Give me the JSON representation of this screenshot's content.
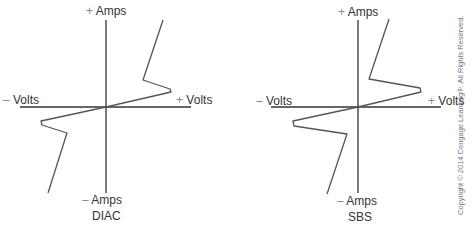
{
  "figures": [
    {
      "id": "diac",
      "caption": "DIAC",
      "labels": {
        "pos_amps": {
          "sign": "+",
          "text": "Amps"
        },
        "neg_amps": {
          "sign": "–",
          "text": "Amps"
        },
        "neg_volts": {
          "sign": "–",
          "text": "Volts"
        },
        "pos_volts": {
          "sign": "+",
          "text": "Volts"
        }
      },
      "axes": {
        "origin": [
          106,
          107
        ],
        "x_range": [
          20,
          191
        ],
        "y_range": [
          20,
          193
        ]
      },
      "curve_points": "163,20 143,80 170,89 171,92 106,107 41,121 42,125 67,133 48,193"
    },
    {
      "id": "sbs",
      "caption": "SBS",
      "labels": {
        "pos_amps": {
          "sign": "+",
          "text": "Amps"
        },
        "neg_amps": {
          "sign": "–",
          "text": "Amps"
        },
        "neg_volts": {
          "sign": "–",
          "text": "Volts"
        },
        "pos_volts": {
          "sign": "+",
          "text": "Volts"
        }
      },
      "axes": {
        "origin": [
          358,
          107
        ],
        "x_range": [
          271,
          441
        ],
        "y_range": [
          20,
          193
        ]
      },
      "curve_points": "389,19 369,79 420,88 421,92 358,107 293,121 294,126 347,134 327,194"
    }
  ],
  "copyright": "Copyright © 2014 Cengage Learning®. All Rights Reserved.",
  "colors": {
    "axis": "#333333",
    "curve": "#555555",
    "text": "#333333"
  }
}
